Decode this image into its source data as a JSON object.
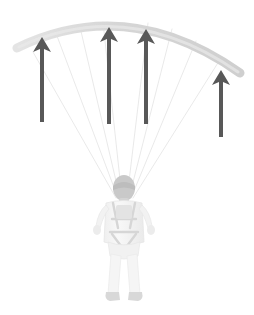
{
  "figure": {
    "width": 254,
    "height": 315,
    "background_color": "#ffffff"
  },
  "colors": {
    "background": "#ffffff",
    "canopy": "#dcdcdc",
    "canopy_shadow": "#d2d2d2",
    "lines": "#e2e2e2",
    "arrow": "#585858",
    "pilot_body": "#f4f4f4",
    "pilot_shade": "#e8e8e8",
    "pilot_head": "#c9c9c9",
    "harness": "#dadada",
    "boots": "#d8d8d8"
  },
  "canopy": {
    "label": "paraglider-canopy",
    "shape": "arc",
    "left_tip": [
      17,
      48
    ],
    "apex": [
      126,
      19
    ],
    "right_tip": [
      240,
      73
    ],
    "band_thickness": 9,
    "color": "#dcdcdc"
  },
  "suspension_lines": {
    "label": "suspension-lines",
    "count": 8,
    "color": "#e2e2e2",
    "stroke_width": 0.7,
    "converge_point": [
      124,
      198
    ],
    "anchors": [
      [
        33,
        52
      ],
      [
        57,
        36
      ],
      [
        80,
        27
      ],
      [
        103,
        22
      ],
      [
        148,
        23
      ],
      [
        172,
        29
      ],
      [
        196,
        41
      ],
      [
        221,
        58
      ]
    ]
  },
  "arrows": {
    "label": "lift-arrows",
    "meaning": "upward lift force",
    "color": "#585858",
    "stem_width": 4,
    "head_width": 18,
    "head_height": 16,
    "count": 5,
    "items": [
      {
        "name": "arrow-1",
        "x": 42,
        "tip_y": 37,
        "base_y": 122
      },
      {
        "name": "arrow-2",
        "x": 109,
        "tip_y": 27,
        "base_y": 124
      },
      {
        "name": "arrow-3",
        "x": 146,
        "tip_y": 29,
        "base_y": 124
      },
      {
        "name": "arrow-4",
        "x": 221,
        "tip_y": 70,
        "base_y": 137
      },
      {
        "name": "arrow-5",
        "x": 42,
        "tip_y": 37,
        "base_y": 122
      }
    ]
  },
  "pilot": {
    "label": "paraglider-pilot",
    "view": "rear",
    "center_x": 124,
    "head": {
      "cx": 124,
      "cy": 188,
      "rx": 11,
      "ry": 13
    },
    "torso": {
      "x": 104,
      "y": 199,
      "w": 40,
      "h": 46
    },
    "harness": {
      "type": "chest-and-leg-straps",
      "color": "#dadada"
    },
    "legs": {
      "top_y": 244,
      "bottom_y": 296
    },
    "boots_y": 296
  }
}
